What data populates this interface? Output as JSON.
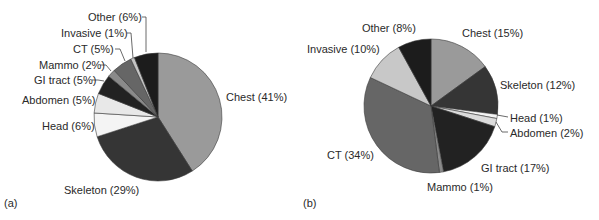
{
  "chart_data": [
    {
      "type": "pie",
      "panel_label": "(a)",
      "start_angle_deg": 0,
      "direction": "clockwise",
      "center": [
        158,
        117
      ],
      "radius": 64,
      "slices": [
        {
          "name": "Chest",
          "value": 41,
          "label": "Chest (41%)",
          "color": "#9a9a9a"
        },
        {
          "name": "Skeleton",
          "value": 29,
          "label": "Skeleton (29%)",
          "color": "#353535"
        },
        {
          "name": "Head",
          "value": 6,
          "label": "Head (6%)",
          "color": "#f4f4f4"
        },
        {
          "name": "Abdomen",
          "value": 5,
          "label": "Abdomen (5%)",
          "color": "#e8e8e8"
        },
        {
          "name": "GI tract",
          "value": 5,
          "label": "GI tract (5%)",
          "color": "#222222"
        },
        {
          "name": "Mammo",
          "value": 2,
          "label": "Mammo (2%)",
          "color": "#8a8a8a"
        },
        {
          "name": "CT",
          "value": 5,
          "label": "CT (5%)",
          "color": "#666666"
        },
        {
          "name": "Invasive",
          "value": 1,
          "label": "Invasive (1%)",
          "color": "#c4c4c4"
        },
        {
          "name": "Other",
          "value": 6,
          "label": "Other (6%)",
          "color": "#1c1c1c"
        }
      ]
    },
    {
      "type": "pie",
      "panel_label": "(b)",
      "start_angle_deg": 0,
      "direction": "clockwise",
      "center": [
        431,
        106
      ],
      "radius": 67,
      "slices": [
        {
          "name": "Chest",
          "value": 15,
          "label": "Chest (15%)",
          "color": "#9a9a9a"
        },
        {
          "name": "Skeleton",
          "value": 12,
          "label": "Skeleton (12%)",
          "color": "#353535"
        },
        {
          "name": "Head",
          "value": 1,
          "label": "Head (1%)",
          "color": "#f4f4f4"
        },
        {
          "name": "Abdomen",
          "value": 2,
          "label": "Abdomen (2%)",
          "color": "#dcdcdc"
        },
        {
          "name": "GI tract",
          "value": 17,
          "label": "GI tract (17%)",
          "color": "#222222"
        },
        {
          "name": "Mammo",
          "value": 1,
          "label": "Mammo (1%)",
          "color": "#8a8a8a"
        },
        {
          "name": "CT",
          "value": 34,
          "label": "CT (34%)",
          "color": "#666666"
        },
        {
          "name": "Invasive",
          "value": 10,
          "label": "Invasive (10%)",
          "color": "#c8c8c8"
        },
        {
          "name": "Other",
          "value": 8,
          "label": "Other (8%)",
          "color": "#1c1c1c"
        }
      ]
    }
  ],
  "labels": {
    "a": {
      "panel": "(a)",
      "chest": "Chest (41%)",
      "skeleton": "Skeleton (29%)",
      "head": "Head (6%)",
      "abdomen": "Abdomen (5%)",
      "gi": "GI tract (5%)",
      "mammo": "Mammo (2%)",
      "ct": "CT (5%)",
      "invasive": "Invasive (1%)",
      "other": "Other (6%)"
    },
    "b": {
      "panel": "(b)",
      "chest": "Chest (15%)",
      "skeleton": "Skeleton (12%)",
      "head": "Head (1%)",
      "abdomen": "Abdomen (2%)",
      "gi": "GI tract (17%)",
      "mammo": "Mammo (1%)",
      "ct": "CT (34%)",
      "invasive": "Invasive (10%)",
      "other": "Other (8%)"
    }
  }
}
